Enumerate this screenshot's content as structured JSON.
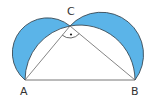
{
  "diagram": {
    "points": {
      "A": {
        "label": "A",
        "x": 25,
        "y": 80
      },
      "B": {
        "label": "B",
        "x": 135,
        "y": 80
      },
      "C": {
        "label": "C",
        "x": 70,
        "y": 26
      }
    },
    "right_angle_at": "C",
    "colors": {
      "lune_fill": "#5bb4e8",
      "stroke": "#3a4a55",
      "line": "#666666"
    }
  }
}
